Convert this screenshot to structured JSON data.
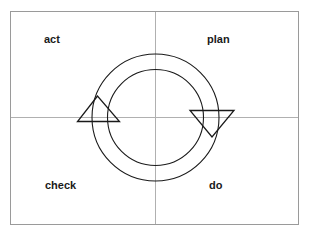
{
  "diagram": {
    "colors": {
      "frame": "#999999",
      "axes": "#aaaaaa",
      "stroke": "#1a1a1a",
      "text": "#1a1a1a",
      "background": "#ffffff"
    },
    "quadrants": {
      "top_left": "act",
      "top_right": "plan",
      "bottom_left": "check",
      "bottom_right": "do"
    },
    "cycle": {
      "direction": "clockwise",
      "arrows": [
        {
          "position": "left",
          "pointing": "up"
        },
        {
          "position": "right",
          "pointing": "down"
        }
      ]
    }
  }
}
